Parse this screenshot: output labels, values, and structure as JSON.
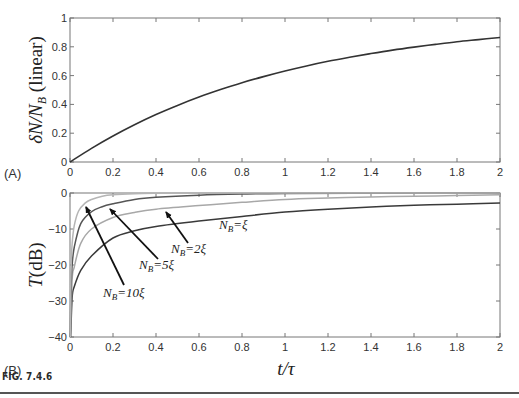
{
  "figure": {
    "caption": "FIG. 7.4.6"
  },
  "chart_data": [
    {
      "type": "line",
      "panel_label": "(A)",
      "title": "",
      "xlabel": "t/τ",
      "ylabel": "δN/N_B (linear)",
      "ylabel_parts": {
        "main": "δN/N",
        "sub": "B",
        "suffix": " (linear)"
      },
      "xlim": [
        0,
        2
      ],
      "ylim": [
        0,
        1
      ],
      "xticks": [
        "0",
        "0.2",
        "0.4",
        "0.6",
        "0.8",
        "1",
        "1.2",
        "1.4",
        "1.6",
        "1.8",
        "2"
      ],
      "yticks": [
        "0",
        "0.2",
        "0.4",
        "0.6",
        "0.8",
        "1"
      ],
      "grid": false,
      "series": [
        {
          "name": "δN/N_B",
          "color": "#333333",
          "x": [
            0,
            0.1,
            0.2,
            0.3,
            0.4,
            0.5,
            0.6,
            0.7,
            0.8,
            0.9,
            1.0,
            1.1,
            1.2,
            1.3,
            1.4,
            1.5,
            1.6,
            1.7,
            1.8,
            1.9,
            2.0
          ],
          "y": [
            0,
            0.095,
            0.181,
            0.259,
            0.33,
            0.393,
            0.451,
            0.503,
            0.551,
            0.593,
            0.632,
            0.667,
            0.699,
            0.727,
            0.753,
            0.777,
            0.798,
            0.817,
            0.835,
            0.85,
            0.865
          ]
        }
      ]
    },
    {
      "type": "line",
      "panel_label": "(B)",
      "title": "",
      "xlabel": "t/τ",
      "ylabel": "T(dB)",
      "ylabel_parts": {
        "main": "T",
        "suffix": "(dB)"
      },
      "xlim": [
        0,
        2
      ],
      "ylim": [
        -40,
        0
      ],
      "xticks": [
        "0",
        "0.2",
        "0.4",
        "0.6",
        "0.8",
        "1",
        "1.2",
        "1.4",
        "1.6",
        "1.8",
        "2"
      ],
      "yticks": [
        "-40",
        "-30",
        "-20",
        "-10",
        "0"
      ],
      "grid": false,
      "series": [
        {
          "name": "N_B=ξ",
          "color": "#3a3a3a",
          "x": [
            0.003,
            0.01,
            0.02,
            0.05,
            0.1,
            0.2,
            0.3,
            0.4,
            0.6,
            0.8,
            1.0,
            1.2,
            1.4,
            1.6,
            1.8,
            2.0
          ],
          "y": [
            -40,
            -29,
            -26,
            -21.5,
            -17.5,
            -12.5,
            -10.5,
            -9.3,
            -7.8,
            -6.5,
            -5.3,
            -4.5,
            -3.9,
            -3.4,
            -3.1,
            -2.8
          ]
        },
        {
          "name": "N_B=2ξ",
          "color": "#a8a8a8",
          "x": [
            0.002,
            0.01,
            0.02,
            0.05,
            0.1,
            0.2,
            0.3,
            0.4,
            0.6,
            0.8,
            1.0,
            1.2,
            1.4,
            1.6,
            1.8,
            2.0
          ],
          "y": [
            -40,
            -24,
            -20.5,
            -14,
            -10,
            -6.8,
            -5.4,
            -4.5,
            -3.5,
            -2.6,
            -1.8,
            -1.4,
            -1.1,
            -0.9,
            -0.7,
            -0.5
          ]
        },
        {
          "name": "N_B=5ξ",
          "color": "#555555",
          "x": [
            0.001,
            0.005,
            0.01,
            0.02,
            0.05,
            0.1,
            0.15,
            0.2,
            0.3,
            0.4,
            0.6,
            0.8,
            1.0,
            1.5,
            2.0
          ],
          "y": [
            -40,
            -26,
            -20,
            -15,
            -8.5,
            -5.2,
            -3.8,
            -3.0,
            -1.8,
            -1.2,
            -0.6,
            -0.3,
            -0.15,
            -0.05,
            0
          ]
        },
        {
          "name": "N_B=10ξ",
          "color": "#b5b5b5",
          "x": [
            0.001,
            0.003,
            0.006,
            0.01,
            0.02,
            0.04,
            0.07,
            0.1,
            0.15,
            0.2,
            0.3,
            0.4,
            0.5,
            0.8,
            2.0
          ],
          "y": [
            -40,
            -27,
            -19,
            -14,
            -9,
            -5,
            -2.8,
            -1.8,
            -0.9,
            -0.5,
            -0.2,
            -0.08,
            -0.03,
            0,
            0
          ]
        }
      ],
      "annotations": [
        {
          "label_main": "N",
          "label_sub": "B",
          "label_rest": "=10ξ",
          "text": "N_B=10ξ",
          "text_x": 103,
          "text_y": 297,
          "arrow_from": [
            124,
            285
          ],
          "arrow_to": [
            86,
            207
          ]
        },
        {
          "label_main": "N",
          "label_sub": "B",
          "label_rest": "=5ξ",
          "text": "N_B=5ξ",
          "text_x": 139,
          "text_y": 269,
          "arrow_from": [
            158,
            259
          ],
          "arrow_to": [
            110,
            209
          ]
        },
        {
          "label_main": "N",
          "label_sub": "B",
          "label_rest": "=2ξ",
          "text": "N_B=2ξ",
          "text_x": 171,
          "text_y": 253,
          "arrow_from": [
            188,
            243
          ],
          "arrow_to": [
            166,
            212
          ]
        },
        {
          "label_main": "N",
          "label_sub": "B",
          "label_rest": "=ξ",
          "text": "N_B=ξ",
          "text_x": 219,
          "text_y": 229,
          "arrow_from": null,
          "arrow_to": null
        }
      ]
    }
  ]
}
